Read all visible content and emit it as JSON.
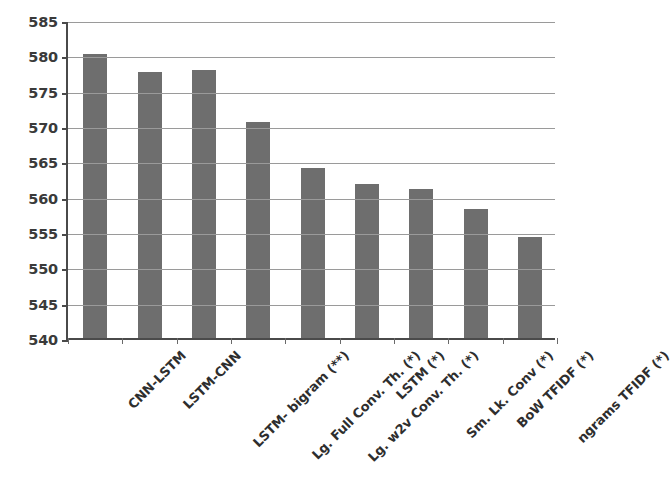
{
  "chart_data": {
    "type": "bar",
    "title": "",
    "subtitle": "",
    "xlabel": "",
    "ylabel": "",
    "categories": [
      "CNN-LSTM",
      "LSTM-CNN",
      "LSTM- bigram (**)",
      "Lg. Full Conv. Th. (*)",
      "Lg. w2v Conv. Th. (*)",
      "LSTM  (*)",
      "Sm. Lk. Conv (*)",
      "BoW TFIDF (*)",
      "ngrams TFIDF (*)"
    ],
    "values": [
      580.2,
      577.6,
      577.9,
      570.6,
      564.0,
      561.8,
      561.1,
      558.2,
      554.3
    ],
    "ylim": [
      540,
      585
    ],
    "ytick_labels": [
      "585",
      "580",
      "575",
      "570",
      "565",
      "560",
      "555",
      "550",
      "545",
      "540"
    ],
    "ytick_values": [
      585,
      580,
      575,
      570,
      565,
      560,
      555,
      550,
      545,
      540
    ],
    "ytick_step": 5,
    "grid": true,
    "grid_axis": "y",
    "legend": false,
    "legend_position": "none",
    "bar_color": "#6e6e6e",
    "axis_color": "#4a4a4a",
    "gridline_color": "#9a9a9a",
    "background_color": "#ffffff",
    "xtick_label_rotation": -45
  }
}
